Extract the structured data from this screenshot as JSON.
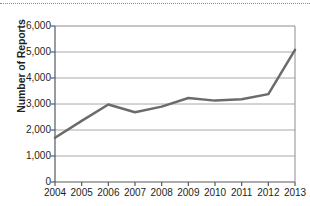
{
  "chart_data": {
    "type": "line",
    "title": "",
    "xlabel": "",
    "ylabel": "Number of Reports",
    "categories": [
      "2004",
      "2005",
      "2006",
      "2007",
      "2008",
      "2009",
      "2010",
      "2011",
      "2012",
      "2013"
    ],
    "values": [
      1700,
      2350,
      2980,
      2680,
      2900,
      3230,
      3130,
      3180,
      3380,
      5080
    ],
    "series": [
      {
        "name": "Number of Reports",
        "values": [
          1700,
          2350,
          2980,
          2680,
          2900,
          3230,
          3130,
          3180,
          3380,
          5080
        ]
      }
    ],
    "ylim": [
      0,
      6000
    ],
    "ytick_labels": [
      "0",
      "1,000",
      "2,000",
      "3,000",
      "4,000",
      "5,000",
      "6,000"
    ],
    "ytick_values": [
      0,
      1000,
      2000,
      3000,
      4000,
      5000,
      6000
    ],
    "grid": "horizontal",
    "legend": "none",
    "line_color": "#6b6b6b",
    "grid_color": "#a8a8a8",
    "axis_color": "#58595b",
    "background_color": "#ffffff"
  },
  "decor": {
    "top_rule_style": "dotted"
  }
}
